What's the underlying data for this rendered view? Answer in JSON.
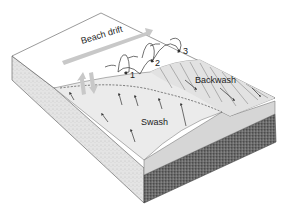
{
  "diagram": {
    "type": "block-diagram",
    "labels": {
      "beach_drift": "Beach drift",
      "swash": "Swash",
      "backwash": "Backwash",
      "step_1": "1",
      "step_2": "2",
      "step_3": "3"
    },
    "colors": {
      "water_surface": "#ffffff",
      "beach_sand": "#e6e6e6",
      "side_face": "#d8d8d8",
      "substrate": "#555555",
      "drift_arrow": "#c8c8c8",
      "line": "#333333"
    }
  }
}
